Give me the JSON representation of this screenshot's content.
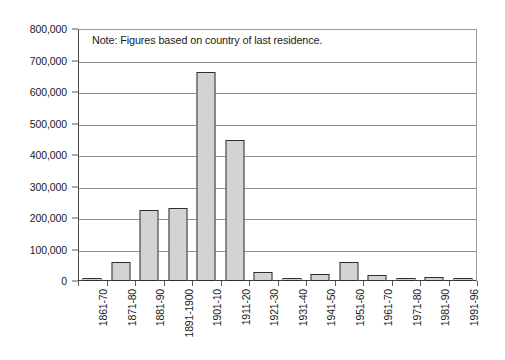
{
  "chart_data": {
    "type": "bar",
    "title": "",
    "subtitle": "",
    "xlabel": "",
    "ylabel": "",
    "ylim": [
      0,
      800000
    ],
    "ytick_step": 100000,
    "grid": true,
    "legend": null,
    "annotation": "Note: Figures based on country of last residence.",
    "categories": [
      "1861-70",
      "1871-80",
      "1881-90",
      "1891-1900",
      "1901-10",
      "1911-20",
      "1921-30",
      "1931-40",
      "1941-50",
      "1951-60",
      "1961-70",
      "1971-80",
      "1981-90",
      "1991-96"
    ],
    "values": [
      7000,
      60000,
      225000,
      232000,
      663000,
      448000,
      28000,
      3000,
      22000,
      60000,
      18000,
      10000,
      13000,
      10000
    ],
    "ytick_labels": [
      "800,000",
      "700,000",
      "600,000",
      "500,000",
      "400,000",
      "300,000",
      "200,000",
      "100,000",
      "0"
    ],
    "ytick_values": [
      800000,
      700000,
      600000,
      500000,
      400000,
      300000,
      200000,
      100000,
      0
    ],
    "colors": {
      "bar_fill": "#d3d3d3",
      "bar_border": "#2e2e2e",
      "gridline": "#8e8e8e",
      "axis": "#3a3a3a",
      "text": "#1a1a1a",
      "background": "#ffffff"
    }
  }
}
